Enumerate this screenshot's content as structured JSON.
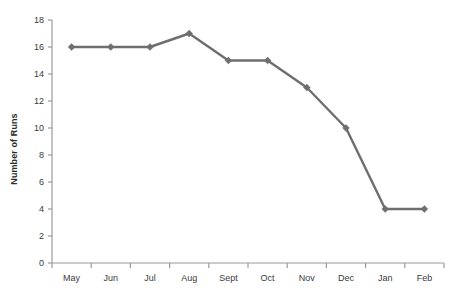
{
  "chart_data": {
    "type": "line",
    "title": "",
    "subtitle": "",
    "xlabel": "",
    "ylabel": "Number of Runs",
    "categories": [
      "May",
      "Jun",
      "Jul",
      "Aug",
      "Sept",
      "Oct",
      "Nov",
      "Dec",
      "Jan",
      "Feb"
    ],
    "values": [
      16,
      16,
      16,
      17,
      15,
      15,
      13,
      10,
      4,
      4
    ],
    "series": [
      {
        "name": "Number of Runs",
        "values": [
          16,
          16,
          16,
          17,
          15,
          15,
          13,
          10,
          4,
          4
        ]
      }
    ],
    "ylim": [
      0,
      18
    ],
    "ytick_values": [
      0,
      2,
      4,
      6,
      8,
      10,
      12,
      14,
      16,
      18
    ],
    "ytick_labels": [
      "0",
      "2",
      "4",
      "6",
      "8",
      "10",
      "12",
      "14",
      "16",
      "18"
    ],
    "xtick_labels": [
      "May",
      "Jun",
      "Jul",
      "Aug",
      "Sept",
      "Oct",
      "Nov",
      "Dec",
      "Jan",
      "Feb"
    ],
    "grid": false,
    "legend": false,
    "legend_position": "none",
    "marker": "diamond",
    "line_color": "#6e6e6e",
    "marker_color": "#6e6e6e",
    "axis_color": "#9a9a9a",
    "text_color": "#3a3a3a",
    "background_color": "#ffffff",
    "annotations": []
  }
}
